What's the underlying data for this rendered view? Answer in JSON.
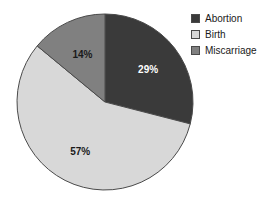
{
  "chart_data": {
    "type": "pie",
    "title": "",
    "categories": [
      "Abortion",
      "Birth",
      "Miscarriage"
    ],
    "values": [
      29,
      57,
      14
    ],
    "value_labels": [
      "29%",
      "57%",
      "14%"
    ],
    "unit": "percent",
    "total": 100,
    "colors": [
      "#3a3a3a",
      "#d8d8d8",
      "#808080"
    ],
    "label_colors": [
      "#ffffff",
      "#1a1a1a",
      "#1a1a1a"
    ],
    "start_angle_deg": 0,
    "direction": "clockwise",
    "legend_position": "top-right",
    "grid": false,
    "xlabel": "",
    "ylabel": "",
    "background": "#ffffff",
    "slice_outline": "#4a4a4a"
  },
  "legend": {
    "entries": [
      {
        "label": "Abortion",
        "color": "#3a3a3a"
      },
      {
        "label": "Birth",
        "color": "#d8d8d8"
      },
      {
        "label": "Miscarriage",
        "color": "#808080"
      }
    ]
  },
  "slices": [
    {
      "name": "Abortion",
      "label": "29%",
      "value": 29
    },
    {
      "name": "Birth",
      "label": "57%",
      "value": 57
    },
    {
      "name": "Miscarriage",
      "label": "14%",
      "value": 14
    }
  ]
}
